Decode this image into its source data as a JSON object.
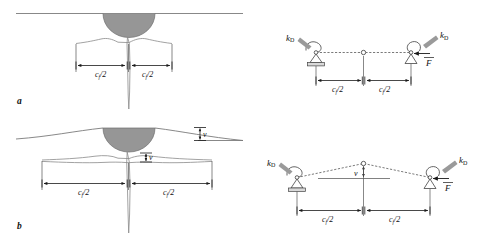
{
  "figure": {
    "type": "technical-diagram",
    "background_color": "#ffffff",
    "width": 491,
    "height": 245
  },
  "colors": {
    "indenter_fill": "#969696",
    "indenter_stroke": "#6f6f6f",
    "surface_line": "#7a7a7a",
    "crack_line": "#8a8a8a",
    "dimension_line": "#1a1a1a",
    "model_beam": "#6b6b6b",
    "support_plate": "#d9d9d9",
    "spring_arrow": "#9a9a9a",
    "text": "#111111"
  },
  "panels": [
    {
      "id": "a",
      "letter": "a",
      "left_view": {
        "name": "indentation-crack-shallow",
        "dimensions": [
          {
            "label": "c",
            "subscript": "f",
            "divisor": "/2",
            "display": "c_f/2",
            "side": "left"
          },
          {
            "label": "c",
            "subscript": "f",
            "divisor": "/2",
            "display": "c_f/2",
            "side": "right"
          }
        ],
        "displacement_labels": []
      },
      "right_view": {
        "name": "spring-hinge-model-flat",
        "springs": [
          {
            "label": "k",
            "subscript": "D",
            "display": "k_D",
            "side": "left"
          },
          {
            "label": "k",
            "subscript": "D",
            "display": "k_D",
            "side": "right"
          }
        ],
        "force": {
          "label": "F",
          "display": "F",
          "notation": "vector-overbar",
          "direction": "left"
        },
        "dimensions": [
          {
            "display": "c_f/2",
            "side": "left"
          },
          {
            "display": "c_f/2",
            "side": "right"
          }
        ],
        "supports": [
          {
            "type": "pinned-hatched",
            "side": "left"
          },
          {
            "type": "roller-triangle",
            "side": "right"
          }
        ],
        "hinge": {
          "type": "open-circle",
          "position": "center",
          "elevation": "flat"
        }
      }
    },
    {
      "id": "b",
      "letter": "b",
      "left_view": {
        "name": "indentation-crack-opened",
        "dimensions": [
          {
            "label": "c",
            "subscript": "f",
            "divisor": "/2",
            "display": "c_f/2",
            "side": "left"
          },
          {
            "label": "c",
            "subscript": "f",
            "divisor": "/2",
            "display": "c_f/2",
            "side": "right"
          }
        ],
        "displacement_labels": [
          {
            "label": "v",
            "display": "v",
            "location": "surface-right"
          },
          {
            "label": "v",
            "display": "v",
            "location": "crack-mid-right"
          }
        ]
      },
      "right_view": {
        "name": "spring-hinge-model-deflected",
        "springs": [
          {
            "label": "k",
            "subscript": "D",
            "display": "k_D",
            "side": "left"
          },
          {
            "label": "k",
            "subscript": "D",
            "display": "k_D",
            "side": "right"
          }
        ],
        "force": {
          "label": "F",
          "display": "F",
          "notation": "vector-overbar",
          "direction": "left"
        },
        "displacement_labels": [
          {
            "label": "v",
            "display": "v",
            "location": "apex-center"
          }
        ],
        "dimensions": [
          {
            "display": "c_f/2",
            "side": "left"
          },
          {
            "display": "c_f/2",
            "side": "right"
          }
        ],
        "supports": [
          {
            "type": "pinned-hatched",
            "side": "left"
          },
          {
            "type": "roller-triangle",
            "side": "right"
          }
        ],
        "hinge": {
          "type": "open-circle",
          "position": "center",
          "elevation": "raised"
        }
      }
    }
  ],
  "labels": {
    "c_half": "c",
    "c_sub": "f",
    "c_div": "/2",
    "v": "v",
    "k": "k",
    "k_sub": "D",
    "F": "F",
    "panel_a": "a",
    "panel_b": "b"
  }
}
